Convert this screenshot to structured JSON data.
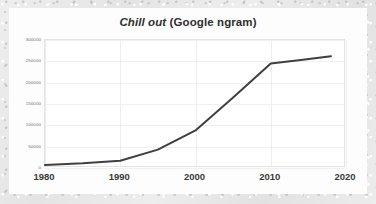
{
  "figure": {
    "background_color": "#e8e8e8",
    "card_color": "#fdfdfd"
  },
  "title": {
    "term": "Chill out",
    "source": " (Google ngram)",
    "full": "Chill out (Google ngram)",
    "color": "#2f2f2f"
  },
  "chart_data": {
    "type": "line",
    "title": "Chill out (Google ngram)",
    "subtitle": "",
    "xlabel": "",
    "ylabel": "",
    "x": [
      1980,
      1985,
      1990,
      1995,
      2000,
      2005,
      2010,
      2014,
      2018
    ],
    "values": [
      7000,
      11000,
      17000,
      43000,
      88000,
      165000,
      245000,
      253000,
      262000
    ],
    "series": [
      {
        "name": "Chill out",
        "color": "#3f3f3f",
        "x": [
          1980,
          1985,
          1990,
          1995,
          2000,
          2005,
          2010,
          2014,
          2018
        ],
        "values": [
          7000,
          11000,
          17000,
          43000,
          88000,
          165000,
          245000,
          253000,
          262000
        ]
      }
    ],
    "xlim": [
      1980,
      2020
    ],
    "ylim": [
      0,
      300000
    ],
    "xticks": [
      1980,
      1990,
      2000,
      2010,
      2020
    ],
    "xtick_labels": [
      "1980",
      "1990",
      "2000",
      "2010",
      "2020"
    ],
    "yticks": [
      0,
      50000,
      100000,
      150000,
      200000,
      250000,
      300000
    ],
    "ytick_labels": [
      "0",
      "50000",
      "100000",
      "150000",
      "200000",
      "250000",
      "300000"
    ],
    "grid": true,
    "grid_color": "#f0f0f0",
    "legend": false,
    "legend_position": "none",
    "line_color": "#3f3f3f",
    "line_width": 2,
    "markers": false
  },
  "axes": {
    "y_tick_color": "#6d6d6d",
    "x_tick_color": "#3a3a3a",
    "frame_color": "#e3e3e3"
  }
}
